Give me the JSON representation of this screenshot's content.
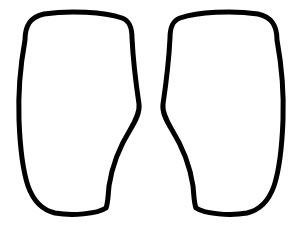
{
  "canvas": {
    "width": 302,
    "height": 228,
    "background_color": "#ffffff",
    "title": "Line art outline drawing"
  },
  "artwork": {
    "name": "paired-leg-outlines",
    "description": "Two mirrored closed outline shapes resembling legs or thighs, drawn as black contour line art on a plain white background",
    "style": "line-art",
    "stroke_color": "#000000",
    "fill_color": "#ffffff",
    "stroke_width": 5,
    "shape_count": 2
  },
  "shapes": [
    {
      "name": "left-leg-outline",
      "label": "Left shape",
      "path": "M 25 40 C 25 26 30 17 44 14 C 70 10 104 12 122 18 C 130 21 132 28 132 38 C 133 58 136 84 139 104 C 140 112 136 120 130 130 C 120 146 112 166 109 186 C 108 196 108 203 106 208 C 97 214 72 216 55 213 C 42 210 33 200 28 186 C 22 168 20 146 19 120 C 18 92 21 62 25 40 Z"
    },
    {
      "name": "right-leg-outline",
      "label": "Right shape",
      "path": "M 277 40 C 277 26 272 17 258 14 C 232 10 198 12 180 18 C 172 21 170 28 170 38 C 169 58 166 84 163 104 C 162 112 166 120 172 130 C 182 146 190 166 193 186 C 194 196 194 203 196 208 C 205 214 230 216 247 213 C 260 210 269 200 274 186 C 280 168 282 146 283 120 C 284 92 281 62 277 40 Z"
    }
  ]
}
